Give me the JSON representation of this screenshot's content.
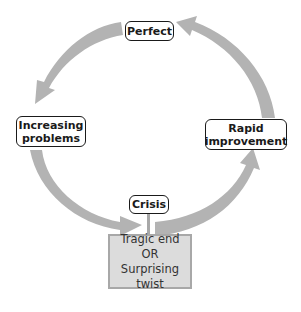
{
  "diagram": {
    "type": "cycle",
    "arrow_color": "#b3b3b3",
    "nodes": {
      "top": {
        "label": "Perfect"
      },
      "left": {
        "line1": "Increasing",
        "line2": "problems"
      },
      "right": {
        "line1": "Rapid",
        "line2": "improvement"
      },
      "bottom": {
        "label": "Crisis"
      }
    },
    "outcome": {
      "line1": "Tragic end",
      "line2": "OR",
      "line3": "Surprising twist"
    },
    "flow": [
      "Perfect",
      "Increasing problems",
      "Crisis",
      "Rapid improvement",
      "Perfect"
    ]
  }
}
